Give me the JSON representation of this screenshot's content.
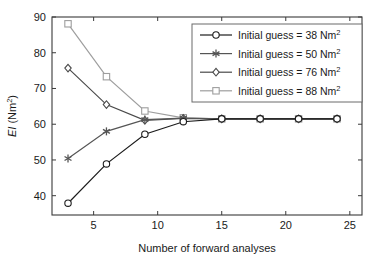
{
  "chart_data": {
    "type": "line",
    "title": "",
    "xlabel": "Number of forward analyses",
    "ylabel": "EI (Nm2)",
    "ylabel_base": "EI (Nm",
    "ylabel_sup": "2",
    "ylabel_tail": ")",
    "xlim": [
      1.75,
      25.95
    ],
    "ylim": [
      34.6,
      90.0
    ],
    "xticks": [
      5,
      10,
      15,
      20,
      25
    ],
    "yticks": [
      40,
      50,
      60,
      70,
      80,
      90
    ],
    "xtick_labels": [
      "5",
      "10",
      "15",
      "20",
      "25"
    ],
    "ytick_labels": [
      "40",
      "50",
      "60",
      "70",
      "80",
      "90"
    ],
    "grid": false,
    "legend_position": "top-right",
    "x": [
      3,
      6,
      9,
      12,
      15,
      18,
      21,
      24
    ],
    "series": [
      {
        "name": "Initial guess = 38 Nm2",
        "label_base": "Initial guess",
        "label_eq": "=",
        "label_value": "38 Nm",
        "label_sup": "2",
        "marker": "circle",
        "color": "#1c1c1c",
        "values": [
          37.9,
          48.9,
          57.2,
          60.7,
          61.5,
          61.5,
          61.5,
          61.5
        ]
      },
      {
        "name": "Initial guess = 50 Nm2",
        "label_base": "Initial guess",
        "label_eq": "=",
        "label_value": "50 Nm",
        "label_sup": "2",
        "marker": "asterisk",
        "color": "#555555",
        "values": [
          50.4,
          58.0,
          61.3,
          61.7,
          61.5,
          61.5,
          61.5,
          61.5
        ]
      },
      {
        "name": "Initial guess = 76 Nm2",
        "label_base": "Initial guess",
        "label_eq": "=",
        "label_value": "76 Nm",
        "label_sup": "2",
        "marker": "diamond",
        "color": "#4a4a4a",
        "values": [
          75.7,
          65.5,
          61.1,
          61.6,
          61.5,
          61.5,
          61.5,
          61.5
        ]
      },
      {
        "name": "Initial guess = 88 Nm2",
        "label_base": "Initial guess",
        "label_eq": "=",
        "label_value": "88 Nm",
        "label_sup": "2",
        "marker": "square",
        "color": "#9e9e9e",
        "values": [
          88.1,
          73.3,
          63.7,
          61.8,
          61.5,
          61.5,
          61.5,
          61.5
        ]
      }
    ],
    "colors": {
      "axis": "#3a3a3a",
      "text": "#1a1a1a",
      "background": "#ffffff",
      "legend_border": "#6a6a6a"
    }
  }
}
